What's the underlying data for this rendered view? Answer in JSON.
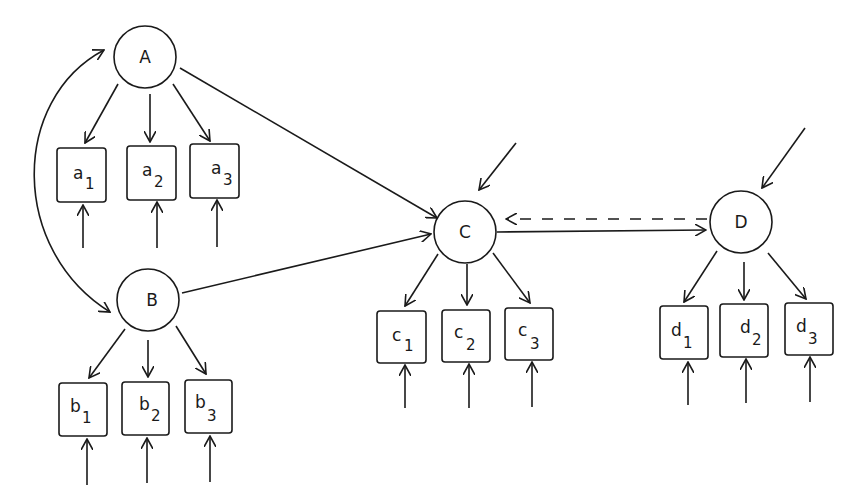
{
  "diagram": {
    "type": "structural-equation-path-diagram",
    "colors": {
      "ink": "#1a1a1a",
      "background": "#ffffff"
    },
    "latent_nodes": [
      {
        "id": "A",
        "label": "A",
        "cx": 145,
        "cy": 57,
        "r": 31
      },
      {
        "id": "B",
        "label": "B",
        "cx": 148,
        "cy": 300,
        "r": 31
      },
      {
        "id": "C",
        "label": "C",
        "cx": 465,
        "cy": 232,
        "r": 31
      },
      {
        "id": "D",
        "label": "D",
        "cx": 741,
        "cy": 222,
        "r": 31
      }
    ],
    "indicator_nodes": [
      {
        "id": "a1",
        "base": "a",
        "sub": "1",
        "parent": "A",
        "x": 57,
        "y": 148,
        "w": 49,
        "h": 54
      },
      {
        "id": "a2",
        "base": "a",
        "sub": "2",
        "parent": "A",
        "x": 127,
        "y": 146,
        "w": 49,
        "h": 54
      },
      {
        "id": "a3",
        "base": "a",
        "sub": "3",
        "parent": "A",
        "x": 190,
        "y": 144,
        "w": 49,
        "h": 54
      },
      {
        "id": "b1",
        "base": "b",
        "sub": "1",
        "parent": "B",
        "x": 59,
        "y": 383,
        "w": 48,
        "h": 53
      },
      {
        "id": "b2",
        "base": "b",
        "sub": "2",
        "parent": "B",
        "x": 122,
        "y": 382,
        "w": 47,
        "h": 53
      },
      {
        "id": "b3",
        "base": "b",
        "sub": "3",
        "parent": "B",
        "x": 185,
        "y": 380,
        "w": 47,
        "h": 53
      },
      {
        "id": "c1",
        "base": "c",
        "sub": "1",
        "parent": "C",
        "x": 377,
        "y": 311,
        "w": 49,
        "h": 52
      },
      {
        "id": "c2",
        "base": "c",
        "sub": "2",
        "parent": "C",
        "x": 442,
        "y": 310,
        "w": 48,
        "h": 52
      },
      {
        "id": "c3",
        "base": "c",
        "sub": "3",
        "parent": "C",
        "x": 505,
        "y": 308,
        "w": 48,
        "h": 52
      },
      {
        "id": "d1",
        "base": "d",
        "sub": "1",
        "parent": "D",
        "x": 660,
        "y": 306,
        "w": 48,
        "h": 53
      },
      {
        "id": "d2",
        "base": "d",
        "sub": "2",
        "parent": "D",
        "x": 720,
        "y": 304,
        "w": 48,
        "h": 53
      },
      {
        "id": "d3",
        "base": "d",
        "sub": "3",
        "parent": "D",
        "x": 785,
        "y": 303,
        "w": 48,
        "h": 52
      }
    ],
    "paths": [
      {
        "id": "A-B-covariance",
        "from": "A",
        "to": "B",
        "style": "curved-double-headed"
      },
      {
        "id": "A-to-C",
        "from": "A",
        "to": "C",
        "style": "solid"
      },
      {
        "id": "B-to-C",
        "from": "B",
        "to": "C",
        "style": "solid"
      },
      {
        "id": "C-to-D",
        "from": "C",
        "to": "D",
        "style": "solid"
      },
      {
        "id": "D-to-C",
        "from": "D",
        "to": "C",
        "style": "dashed"
      },
      {
        "id": "disturbance-C",
        "to": "C",
        "style": "solid"
      },
      {
        "id": "disturbance-D",
        "to": "D",
        "style": "solid"
      }
    ]
  }
}
